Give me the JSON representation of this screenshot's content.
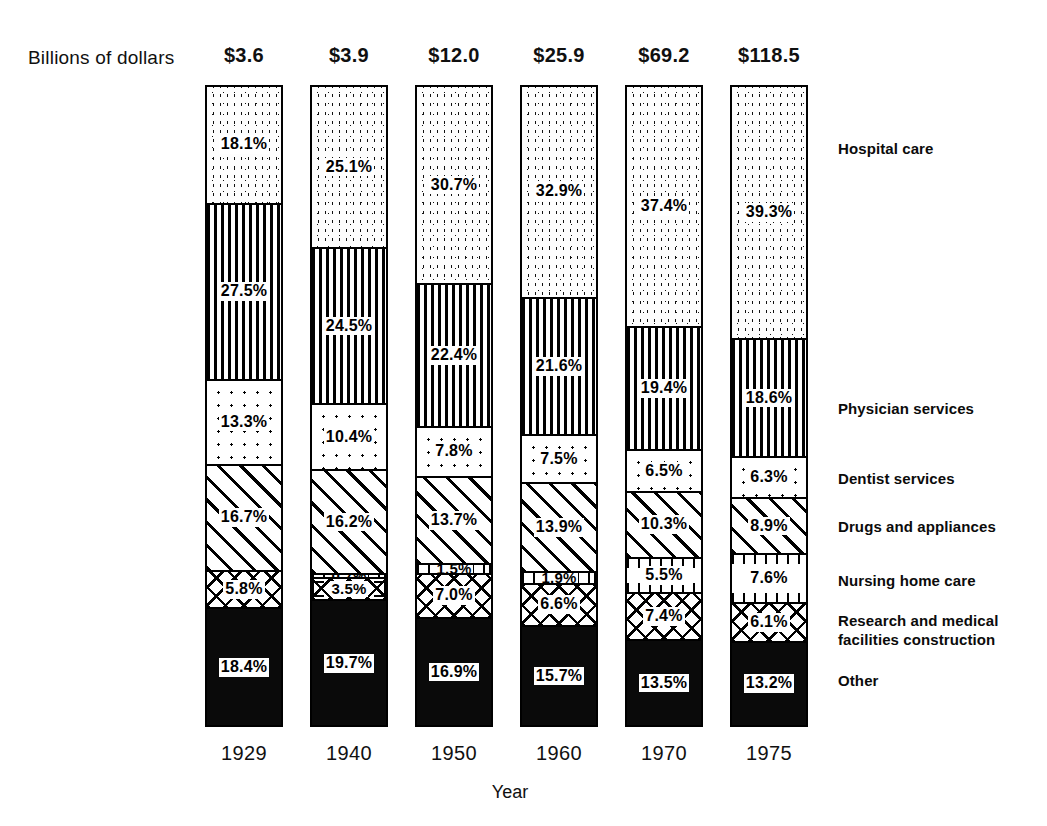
{
  "header": {
    "axis_title": "Billions of dollars"
  },
  "footer": {
    "x_axis_title": "Year"
  },
  "chart_data": {
    "type": "bar",
    "subtype": "100% stacked column",
    "title": "",
    "xlabel": "Year",
    "ylabel": "Billions of dollars",
    "ylim": [
      0,
      100
    ],
    "grid": false,
    "legend_position": "right",
    "categories": [
      "1929",
      "1940",
      "1950",
      "1960",
      "1970",
      "1975"
    ],
    "totals": [
      "$3.6",
      "$3.9",
      "$12.0",
      "$25.9",
      "$69.2",
      "$118.5"
    ],
    "totals_numeric": [
      3.6,
      3.9,
      12.0,
      25.9,
      69.2,
      118.5
    ],
    "totals_units": "billions of dollars",
    "series": [
      {
        "name": "Hospital care",
        "pattern": "stipple",
        "values": [
          18.1,
          25.1,
          30.7,
          32.9,
          37.4,
          39.3
        ],
        "labels": [
          "18.1%",
          "25.1%",
          "30.7%",
          "32.9%",
          "37.4%",
          "39.3%"
        ]
      },
      {
        "name": "Physician services",
        "pattern": "vertical-lines",
        "values": [
          27.5,
          24.5,
          22.4,
          21.6,
          19.4,
          18.6
        ],
        "labels": [
          "27.5%",
          "24.5%",
          "22.4%",
          "21.6%",
          "19.4%",
          "18.6%"
        ]
      },
      {
        "name": "Dentist services",
        "pattern": "dot-grid",
        "values": [
          13.3,
          10.4,
          7.8,
          7.5,
          6.5,
          6.3
        ],
        "labels": [
          "13.3%",
          "10.4%",
          "7.8%",
          "7.5%",
          "6.5%",
          "6.3%"
        ]
      },
      {
        "name": "Drugs and appliances",
        "pattern": "diagonal-hatch",
        "values": [
          16.7,
          16.2,
          13.7,
          13.9,
          10.3,
          8.9
        ],
        "labels": [
          "16.7%",
          "16.2%",
          "13.7%",
          "13.9%",
          "10.3%",
          "8.9%"
        ]
      },
      {
        "name": "Nursing home care",
        "pattern": "ticked-band",
        "values": [
          0,
          0.7,
          1.5,
          1.9,
          5.5,
          7.6
        ],
        "labels": [
          "",
          "0.7%",
          "1.5%",
          "1.9%",
          "5.5%",
          "7.6%"
        ]
      },
      {
        "name": "Research and medical facilities construction",
        "pattern": "cross-hatch",
        "values": [
          5.8,
          3.5,
          7.0,
          6.6,
          7.4,
          6.1
        ],
        "labels": [
          "5.8%",
          "3.5%",
          "7.0%",
          "6.6%",
          "7.4%",
          "6.1%"
        ]
      },
      {
        "name": "Other",
        "pattern": "solid-black",
        "values": [
          18.4,
          19.7,
          16.9,
          15.7,
          13.5,
          13.2
        ],
        "labels": [
          "18.4%",
          "19.7%",
          "16.9%",
          "15.7%",
          "13.5%",
          "13.2%"
        ]
      }
    ]
  },
  "legend": [
    {
      "label": "Hospital care",
      "top": 140
    },
    {
      "label": "Physician services",
      "top": 400
    },
    {
      "label": "Dentist services",
      "top": 470
    },
    {
      "label": "Drugs and appliances",
      "top": 518
    },
    {
      "label": "Nursing home care",
      "top": 572
    },
    {
      "label": "Research and medical\nfacilities construction",
      "top": 612
    },
    {
      "label": "Other",
      "top": 672
    }
  ]
}
